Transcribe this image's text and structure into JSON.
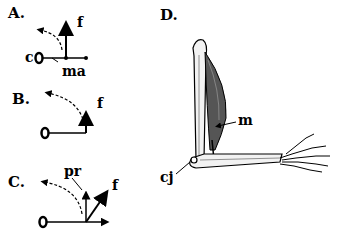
{
  "panels": {
    "A": {
      "label": "A.",
      "force": "f",
      "center": "c",
      "moment_arm": "ma"
    },
    "B": {
      "label": "B.",
      "force": "f"
    },
    "C": {
      "label": "C.",
      "force": "f",
      "perpendicular": "pr"
    },
    "D": {
      "label": "D.",
      "muscle": "m",
      "center_joint": "cj"
    }
  },
  "colors": {
    "ink": "#000000",
    "bone": "#f2f2f2",
    "muscle": "#555555"
  }
}
